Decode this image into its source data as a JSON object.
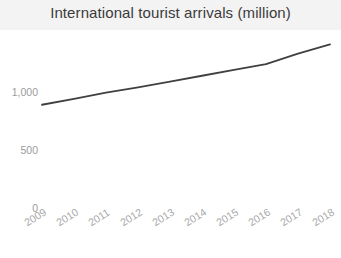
{
  "chart_data": {
    "type": "line",
    "title": "International tourist arrivals (million)",
    "xlabel": "",
    "ylabel": "",
    "categories": [
      "2009",
      "2010",
      "2011",
      "2012",
      "2013",
      "2014",
      "2015",
      "2016",
      "2017",
      "2018"
    ],
    "values": [
      890,
      940,
      995,
      1040,
      1090,
      1140,
      1190,
      1240,
      1330,
      1410
    ],
    "series": [
      {
        "name": "International tourist arrivals",
        "values": [
          890,
          940,
          995,
          1040,
          1090,
          1140,
          1190,
          1240,
          1330,
          1410
        ]
      }
    ],
    "ylim": [
      0,
      1500
    ],
    "y_ticks": [
      0,
      500,
      1000
    ],
    "y_tick_labels": [
      "0",
      "500",
      "1,000"
    ],
    "grid": false,
    "legend": false,
    "legend_position": "none",
    "line_color": "#404040",
    "title_band_color": "#f3f3f3",
    "tick_label_color": "#a0a0a0",
    "x_tick_rotation": -32
  },
  "title": {
    "text": "International tourist arrivals (million)"
  },
  "y_axis": {
    "ticks": [
      {
        "label": "1,000",
        "value": 1000
      },
      {
        "label": "500",
        "value": 500
      },
      {
        "label": "0",
        "value": 0
      }
    ]
  },
  "x_axis": {
    "ticks": [
      {
        "label": "2009"
      },
      {
        "label": "2010"
      },
      {
        "label": "2011"
      },
      {
        "label": "2012"
      },
      {
        "label": "2013"
      },
      {
        "label": "2014"
      },
      {
        "label": "2015"
      },
      {
        "label": "2016"
      },
      {
        "label": "2017"
      },
      {
        "label": "2018"
      }
    ]
  }
}
